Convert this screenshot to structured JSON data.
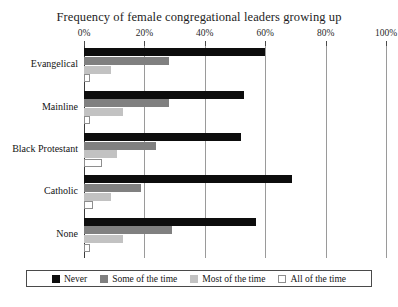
{
  "chart_data": {
    "type": "bar",
    "orientation": "horizontal",
    "title": "Frequency of female congregational leaders growing up",
    "xlabel": "",
    "ylabel": "",
    "xlim": [
      0,
      100
    ],
    "xticks": [
      0,
      20,
      40,
      60,
      80,
      100
    ],
    "xtick_labels": [
      "0%",
      "20%",
      "40%",
      "60%",
      "80%",
      "100%"
    ],
    "grid": true,
    "legend_position": "bottom",
    "categories": [
      "Evangelical",
      "Mainline",
      "Black Protestant",
      "Catholic",
      "None"
    ],
    "series": [
      {
        "name": "Never",
        "color": "#0d0d0d",
        "values": [
          60,
          53,
          52,
          69,
          57
        ]
      },
      {
        "name": "Some of the time",
        "color": "#808080",
        "values": [
          28,
          28,
          24,
          19,
          29
        ]
      },
      {
        "name": "Most of the time",
        "color": "#c2c2c2",
        "values": [
          9,
          13,
          11,
          9,
          13
        ]
      },
      {
        "name": "All of the time",
        "color": "#ffffff",
        "values": [
          2,
          2,
          6,
          3,
          2
        ]
      }
    ]
  },
  "caption": {
    "partial_text": ""
  }
}
